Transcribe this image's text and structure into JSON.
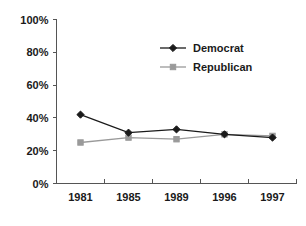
{
  "chart_data": {
    "type": "line",
    "title": "",
    "xlabel": "",
    "ylabel": "",
    "categories": [
      "1981",
      "1985",
      "1989",
      "1996",
      "1997"
    ],
    "ylim": [
      0,
      100
    ],
    "yticks": [
      0,
      20,
      40,
      60,
      80,
      100
    ],
    "ytick_labels": [
      "0%",
      "20%",
      "40%",
      "60%",
      "80%",
      "100%"
    ],
    "grid": false,
    "legend_position": "upper-center-right",
    "series": [
      {
        "name": "Democrat",
        "color": "#1a1a1a",
        "marker": "diamond",
        "values": [
          42,
          31,
          33,
          30,
          28
        ]
      },
      {
        "name": "Republican",
        "color": "#9a9a9a",
        "marker": "square",
        "values": [
          25,
          28,
          27,
          30,
          29
        ]
      }
    ]
  },
  "legend": {
    "items": [
      {
        "label": "Democrat"
      },
      {
        "label": "Republican"
      }
    ]
  },
  "axes": {
    "y_labels": [
      "100%",
      "80%",
      "60%",
      "40%",
      "20%",
      "0%"
    ],
    "x_labels": [
      "1981",
      "1985",
      "1989",
      "1996",
      "1997"
    ]
  }
}
